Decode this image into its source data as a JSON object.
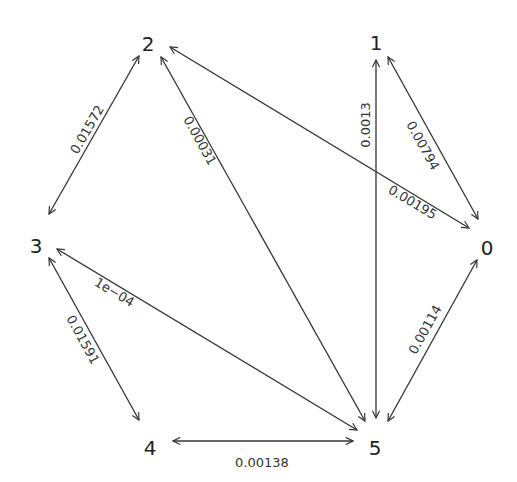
{
  "diagram": {
    "type": "directed-graph",
    "nodes": [
      {
        "id": "0",
        "label": "0",
        "x": 487,
        "y": 249
      },
      {
        "id": "1",
        "label": "1",
        "x": 376,
        "y": 44
      },
      {
        "id": "2",
        "label": "2",
        "x": 148,
        "y": 45
      },
      {
        "id": "3",
        "label": "3",
        "x": 36,
        "y": 247
      },
      {
        "id": "4",
        "label": "4",
        "x": 150,
        "y": 449
      },
      {
        "id": "5",
        "label": "5",
        "x": 375,
        "y": 449
      }
    ],
    "edges": [
      {
        "from": "2",
        "to": "3",
        "label": "0.01572",
        "x1": 139,
        "y1": 56,
        "x2": 49,
        "y2": 214,
        "lx": 88,
        "ly": 130,
        "angle": -60
      },
      {
        "from": "2",
        "to": "5",
        "label": "0.00031",
        "x1": 161,
        "y1": 57,
        "x2": 365,
        "y2": 421,
        "lx": 199,
        "ly": 141,
        "angle": 61
      },
      {
        "from": "2",
        "to": "0",
        "label": "0.00195",
        "x1": 170,
        "y1": 47,
        "x2": 469,
        "y2": 228,
        "lx": 412,
        "ly": 203,
        "angle": 31
      },
      {
        "from": "1",
        "to": "5",
        "label": "0.0013",
        "x1": 376,
        "y1": 60,
        "x2": 376,
        "y2": 418,
        "lx": 366,
        "ly": 125,
        "angle": -90
      },
      {
        "from": "1",
        "to": "0",
        "label": "0.00794",
        "x1": 388,
        "y1": 57,
        "x2": 478,
        "y2": 219,
        "lx": 422,
        "ly": 146,
        "angle": 61
      },
      {
        "from": "0",
        "to": "5",
        "label": "0.00114",
        "x1": 477,
        "y1": 260,
        "x2": 388,
        "y2": 421,
        "lx": 426,
        "ly": 330,
        "angle": -61
      },
      {
        "from": "3",
        "to": "5",
        "label": "1e−04",
        "x1": 57,
        "y1": 249,
        "x2": 357,
        "y2": 430,
        "lx": 114,
        "ly": 293,
        "angle": 31
      },
      {
        "from": "3",
        "to": "4",
        "label": "0.01591",
        "x1": 49,
        "y1": 258,
        "x2": 139,
        "y2": 420,
        "lx": 82,
        "ly": 340,
        "angle": 61
      },
      {
        "from": "4",
        "to": "5",
        "label": "0.00138",
        "x1": 173,
        "y1": 441,
        "x2": 353,
        "y2": 441,
        "lx": 262,
        "ly": 463,
        "angle": 0
      }
    ],
    "colors": {
      "edge": "#333333",
      "node_text": "#222222",
      "background": "#ffffff"
    }
  }
}
